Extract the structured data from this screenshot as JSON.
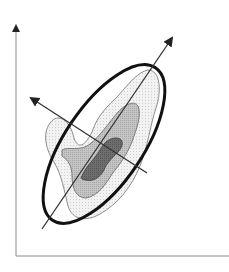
{
  "diagram": {
    "type": "principal-component-ellipse",
    "width": 229,
    "height": 272,
    "colors": {
      "background": "#ffffff",
      "axis": "#8a8a8a",
      "axis_arrow": "#222222",
      "ellipse": "#111111",
      "principal_axis": "#333333",
      "contour_outer_fill": "#eeeeee",
      "contour_outer_stroke": "#8c8c8c",
      "contour_mid_fill": "#bdbdbd",
      "contour_mid_stroke": "#7a7a7a",
      "contour_inner_fill": "#6b6b6b",
      "contour_inner_stroke": "#4a4a4a"
    },
    "axes": {
      "y_axis": {
        "x": 16,
        "y_top": 26,
        "y_bottom": 256
      },
      "x_axis": {
        "y": 256,
        "x_left": 16,
        "x_right": 229
      }
    },
    "ellipse": {
      "cx": 104,
      "cy": 144,
      "rx": 92,
      "ry": 39,
      "rotation_deg": -56,
      "stroke_width": 3
    },
    "principal_axes": [
      {
        "name": "major",
        "x1": 42,
        "y1": 229,
        "x2": 172,
        "y2": 38
      },
      {
        "name": "minor",
        "x1": 147,
        "y1": 173,
        "x2": 31,
        "y2": 98
      }
    ],
    "contours": {
      "outer": "M 50 123 C 58 112, 70 120, 74 138 C 78 150, 85 146, 92 132 C 98 114, 108 106, 118 96 C 130 82, 138 72, 148 70 C 160 70, 162 90, 156 108 C 150 126, 148 146, 140 166 C 132 186, 118 204, 100 214 C 86 222, 72 220, 68 206 C 64 190, 62 176, 54 162 C 46 150, 42 134, 50 123 Z",
      "mid": "M 62 150 C 68 146, 80 152, 90 144 C 100 136, 108 124, 118 112 C 126 104, 134 100, 138 106 C 142 116, 136 130, 132 142 C 126 156, 120 164, 112 174 C 106 184, 98 196, 86 198 C 76 198, 72 188, 72 176 C 72 166, 68 160, 62 156 Z",
      "inner": "M 82 176 C 86 166, 94 160, 100 150 C 104 142, 110 138, 116 138 C 124 138, 124 146, 118 152 C 112 158, 106 164, 104 170 C 100 178, 92 182, 86 180 C 82 180, 80 178, 82 176 Z"
    }
  }
}
